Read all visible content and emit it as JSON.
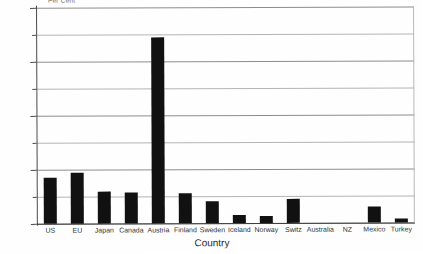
{
  "chart_data": {
    "type": "bar",
    "title": "",
    "xlabel": "Country",
    "ylabel": "Per Cent",
    "ylim": [
      0,
      80
    ],
    "ytick_values": [
      0,
      20,
      40,
      60,
      80
    ],
    "yminor_values": [
      10,
      30,
      50,
      70
    ],
    "grid": "horizontal",
    "legend": "none",
    "bar_color": "#111111",
    "categories": [
      "US",
      "EU",
      "Japan",
      "Canada",
      "Austria",
      "Finland",
      "Sweden",
      "Iceland",
      "Norway",
      "Switz",
      "Australia",
      "NZ",
      "Mexico",
      "Turkey"
    ],
    "values": [
      17,
      19,
      12,
      11.5,
      69,
      11,
      8,
      3,
      2.5,
      9,
      0,
      0,
      6,
      1.5
    ]
  },
  "axes": {
    "y_title": "Per Cent",
    "x_title": "Country",
    "y_ticks": [
      {
        "label": "80",
        "value": 80
      },
      {
        "label": "60",
        "value": 60
      },
      {
        "label": "40",
        "value": 40
      },
      {
        "label": "20",
        "value": 20
      },
      {
        "label": "0",
        "value": 0
      }
    ]
  },
  "page": {
    "corner_note": "",
    "background": "#ffffff"
  }
}
